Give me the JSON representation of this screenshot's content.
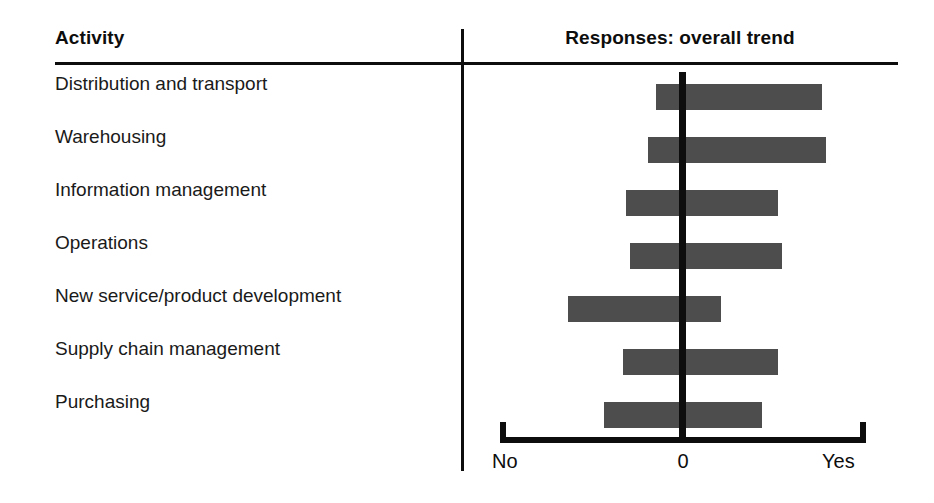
{
  "figure": {
    "background": "#ffffff",
    "bar_color": "#4d4d4d",
    "line_color": "#0d0d0d"
  },
  "columns": {
    "activity_header": "Activity",
    "responses_header": "Responses: overall trend"
  },
  "axis": {
    "left_label": "No",
    "center_label": "0",
    "right_label": "Yes"
  },
  "rows": [
    {
      "label": "Distribution and transport"
    },
    {
      "label": "Warehousing"
    },
    {
      "label": "Information management"
    },
    {
      "label": "Operations"
    },
    {
      "label": "New service/product development"
    },
    {
      "label": "Supply chain management"
    },
    {
      "label": "Purchasing"
    }
  ],
  "chart_data": {
    "type": "bar",
    "orientation": "horizontal",
    "title": "Responses: overall trend",
    "xlabel": "",
    "ylabel": "Activity",
    "xlim": [
      -1,
      1
    ],
    "grid": false,
    "legend": null,
    "zero_reference": 0,
    "axis_tick_labels": {
      "-1": "No",
      "0": "0",
      "1": "Yes"
    },
    "note": "Each bar is a floating range (low to high) spanning the spread of responses around the zero reference.",
    "categories": [
      "Distribution and transport",
      "Warehousing",
      "Information management",
      "Operations",
      "New service/product development",
      "Supply chain management",
      "Purchasing"
    ],
    "ranges": [
      {
        "category": "Distribution and transport",
        "low": -0.15,
        "high": 0.76
      },
      {
        "category": "Warehousing",
        "low": -0.19,
        "high": 0.78
      },
      {
        "category": "Information management",
        "low": -0.31,
        "high": 0.52
      },
      {
        "category": "Operations",
        "low": -0.29,
        "high": 0.54
      },
      {
        "category": "New service/product development",
        "low": -0.63,
        "high": 0.21
      },
      {
        "category": "Supply chain management",
        "low": -0.33,
        "high": 0.52
      },
      {
        "category": "Purchasing",
        "low": -0.43,
        "high": 0.43
      }
    ]
  },
  "geometry": {
    "plot_left_px": 500,
    "plot_right_px": 866,
    "zero_px": 683,
    "bar_height_px": 26,
    "first_bar_top_px": 84,
    "row_pitch_px": 53
  }
}
